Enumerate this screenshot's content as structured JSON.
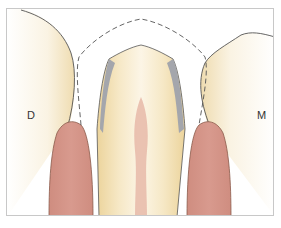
{
  "figure": {
    "labels": {
      "distal": "D",
      "mesial": "M"
    },
    "colors": {
      "gum": "#d4958a",
      "gum_outline": "#8a5a4a",
      "tooth_light": "#faf3e3",
      "tooth_warm": "#f0ddb0",
      "pulp": "#e6b8a8",
      "metal_shadow": "#a4a6ac",
      "outline": "#555555",
      "dashed": "#555555",
      "frame": "#c8c8c8"
    },
    "elements": [
      "distal-adjacent-tooth",
      "mesial-adjacent-tooth",
      "prepared-central-tooth",
      "pulp-canal",
      "metal-coping-shadow",
      "crown-outline-dashed",
      "distal-gingival-papilla",
      "mesial-gingival-papilla"
    ]
  }
}
